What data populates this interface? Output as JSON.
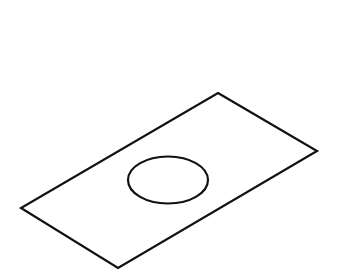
{
  "diagram": {
    "type": "isometric-line-drawing",
    "background": "#ffffff",
    "stroke_color": "#111111",
    "stroke_width": 2.2,
    "plate": {
      "vertices": [
        [
          218,
          93
        ],
        [
          317,
          151
        ],
        [
          118,
          268
        ],
        [
          21,
          208
        ]
      ]
    },
    "hole": {
      "cx": 168,
      "cy": 180,
      "rx": 40,
      "ry": 23.5
    }
  }
}
